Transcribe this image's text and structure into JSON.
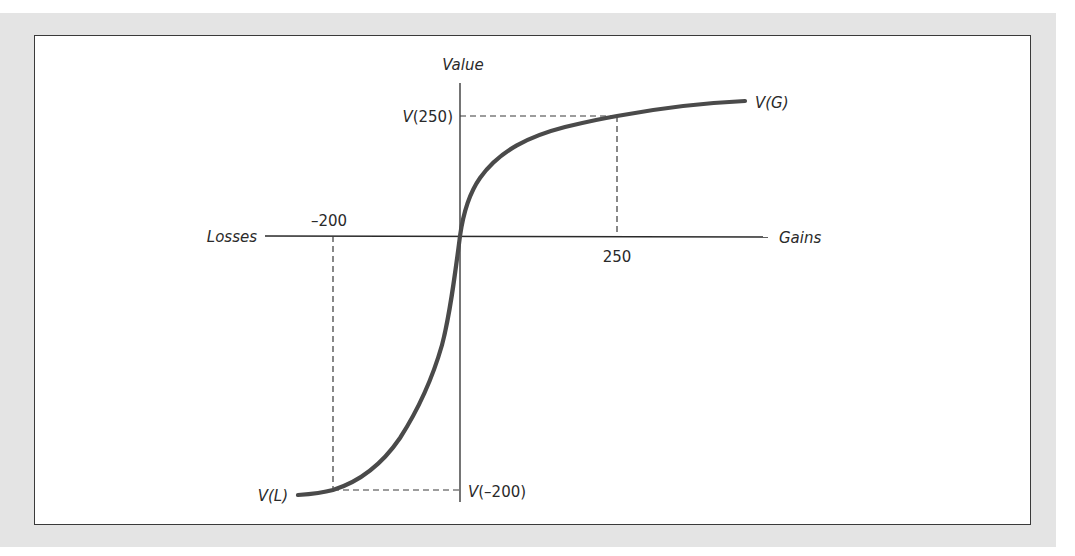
{
  "figure": {
    "type": "prospect-theory-value-function",
    "axes": {
      "y_label": "Value",
      "x_negative_label": "Losses",
      "x_positive_label": "Gains"
    },
    "ticks": {
      "neg_x": "–200",
      "pos_x": "250"
    },
    "annotations": {
      "v_250": "(250)",
      "v_250_prefix": "V",
      "v_neg200": "(–200)",
      "v_neg200_prefix": "V",
      "v_gains": "V(G)",
      "v_losses": "V(L)"
    },
    "colors": {
      "background_panel": "#e4e4e4",
      "frame_border": "#3a3a3a",
      "curve": "#4a4a4a",
      "axis": "#2a2a2a",
      "dashed": "#3a3a3a"
    }
  }
}
